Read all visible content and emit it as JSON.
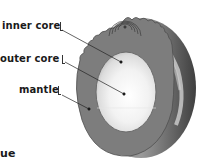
{
  "diagram": {
    "labels": [
      {
        "id": "inner-core",
        "text": "inner core"
      },
      {
        "id": "outer-core",
        "text": "outer core"
      },
      {
        "id": "mantle",
        "text": "mantle"
      }
    ],
    "footer_fragment": "ue",
    "colors": {
      "mantle": "#7d7d7d",
      "mantle_edge": "#5a5a5a",
      "core_outer_rim": "#c9c9c9",
      "core_center": "#ffffff",
      "crust_highlight": "#d8d8d8",
      "leader_line": "#222222",
      "text": "#1a1a1a"
    }
  }
}
